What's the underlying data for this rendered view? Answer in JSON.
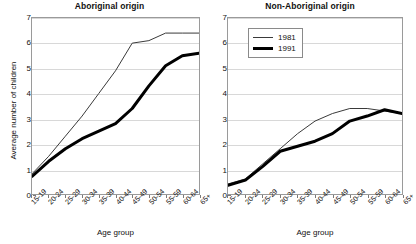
{
  "figure": {
    "background": "#ffffff",
    "axis_color": "#9a9a9a",
    "grid_color": "#d8d8d8"
  },
  "axes": {
    "y_title": "Average number of children",
    "x_title_left": "Age group",
    "x_title_right": "Age group",
    "y_ticks": [
      "0",
      "1",
      "2",
      "3",
      "4",
      "5",
      "6",
      "7"
    ],
    "x_ticks": [
      "15-19",
      "20-24",
      "25-29",
      "30-34",
      "35-39",
      "40-44",
      "45-49",
      "50-54",
      "55-59",
      "60-64",
      "65+"
    ]
  },
  "legend": {
    "position": "top-left-of-right-panel",
    "items": [
      {
        "label": "1981",
        "style": "thin",
        "color": "#3a3a3a"
      },
      {
        "label": "1991",
        "style": "thick",
        "color": "#000000"
      }
    ]
  },
  "chart_data": [
    {
      "type": "line",
      "title": "Aboriginal origin",
      "xlabel": "Age group",
      "ylabel": "Average number of children",
      "ylim": [
        0,
        7
      ],
      "grid": true,
      "legend": "none",
      "categories": [
        "15-19",
        "20-24",
        "25-29",
        "30-34",
        "35-39",
        "40-44",
        "45-49",
        "50-54",
        "55-59",
        "60-64",
        "65+"
      ],
      "series": [
        {
          "name": "1981",
          "style": "thin",
          "color": "#3a3a3a",
          "values": [
            0.8,
            1.5,
            2.3,
            3.1,
            4.0,
            4.9,
            6.0,
            6.1,
            6.4,
            6.4,
            6.4
          ]
        },
        {
          "name": "1991",
          "style": "thick",
          "color": "#000000",
          "values": [
            0.7,
            1.3,
            1.8,
            2.2,
            2.5,
            2.8,
            3.4,
            4.3,
            5.1,
            5.5,
            5.6
          ]
        }
      ]
    },
    {
      "type": "line",
      "title": "Non-Aboriginal origin",
      "xlabel": "Age group",
      "ylabel": "Average number of children",
      "ylim": [
        0,
        7
      ],
      "grid": true,
      "legend": "top-left",
      "categories": [
        "15-19",
        "20-24",
        "25-29",
        "30-34",
        "35-39",
        "40-44",
        "45-49",
        "50-54",
        "55-59",
        "60-64",
        "65+"
      ],
      "series": [
        {
          "name": "1981",
          "style": "thin",
          "color": "#3a3a3a",
          "values": [
            0.4,
            0.6,
            1.2,
            1.8,
            2.4,
            2.9,
            3.2,
            3.4,
            3.4,
            3.3,
            3.2
          ]
        },
        {
          "name": "1991",
          "style": "thick",
          "color": "#000000",
          "values": [
            0.35,
            0.55,
            1.1,
            1.7,
            1.9,
            2.1,
            2.4,
            2.9,
            3.1,
            3.35,
            3.2
          ]
        }
      ]
    }
  ]
}
